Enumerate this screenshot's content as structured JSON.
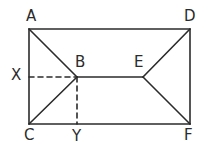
{
  "figure": {
    "kind": "geometry-diagram",
    "canvas": {
      "width": 205,
      "height": 151
    },
    "background_color": "#ffffff",
    "stroke_color": "#2b2b2b",
    "stroke_width": 1.6
  },
  "points": [
    {
      "id": "A",
      "label": "A",
      "x": 29,
      "y": 29,
      "label_x": 26,
      "label_y": 9,
      "kind": "rect-corner"
    },
    {
      "id": "D",
      "label": "D",
      "x": 190,
      "y": 29,
      "label_x": 184,
      "label_y": 9,
      "kind": "rect-corner"
    },
    {
      "id": "C",
      "label": "C",
      "x": 29,
      "y": 124,
      "label_x": 24,
      "label_y": 128,
      "kind": "rect-corner"
    },
    {
      "id": "F",
      "label": "F",
      "x": 190,
      "y": 124,
      "label_x": 184,
      "label_y": 128,
      "kind": "rect-corner"
    },
    {
      "id": "B",
      "label": "B",
      "x": 77,
      "y": 77,
      "label_x": 75,
      "label_y": 55,
      "kind": "interior-vertex"
    },
    {
      "id": "E",
      "label": "E",
      "x": 143,
      "y": 77,
      "label_x": 134,
      "label_y": 55,
      "kind": "interior-vertex"
    },
    {
      "id": "X",
      "label": "X",
      "x": 29,
      "y": 77,
      "label_x": 11,
      "label_y": 68,
      "kind": "foot-of-perpendicular"
    },
    {
      "id": "Y",
      "label": "Y",
      "x": 77,
      "y": 124,
      "label_x": 72,
      "label_y": 129,
      "kind": "foot-of-perpendicular"
    }
  ],
  "segments": [
    {
      "id": "AD",
      "from": "A",
      "to": "D",
      "style": "solid",
      "x1": 29,
      "y1": 29,
      "x2": 190,
      "y2": 29
    },
    {
      "id": "DF",
      "from": "D",
      "to": "F",
      "style": "solid",
      "x1": 190,
      "y1": 29,
      "x2": 190,
      "y2": 124
    },
    {
      "id": "FC",
      "from": "F",
      "to": "C",
      "style": "solid",
      "x1": 190,
      "y1": 124,
      "x2": 29,
      "y2": 124
    },
    {
      "id": "CA",
      "from": "C",
      "to": "A",
      "style": "solid",
      "x1": 29,
      "y1": 124,
      "x2": 29,
      "y2": 29
    },
    {
      "id": "AB",
      "from": "A",
      "to": "B",
      "style": "solid",
      "x1": 29,
      "y1": 29,
      "x2": 77,
      "y2": 77
    },
    {
      "id": "CB",
      "from": "C",
      "to": "B",
      "style": "solid",
      "x1": 29,
      "y1": 124,
      "x2": 77,
      "y2": 77
    },
    {
      "id": "BE",
      "from": "B",
      "to": "E",
      "style": "solid",
      "x1": 77,
      "y1": 77,
      "x2": 143,
      "y2": 77
    },
    {
      "id": "DE",
      "from": "D",
      "to": "E",
      "style": "solid",
      "x1": 190,
      "y1": 29,
      "x2": 143,
      "y2": 77
    },
    {
      "id": "FE",
      "from": "F",
      "to": "E",
      "style": "solid",
      "x1": 190,
      "y1": 124,
      "x2": 143,
      "y2": 77
    },
    {
      "id": "XB",
      "from": "X",
      "to": "B",
      "style": "dashed",
      "x1": 29,
      "y1": 77,
      "x2": 77,
      "y2": 77
    },
    {
      "id": "BY",
      "from": "B",
      "to": "Y",
      "style": "dashed",
      "x1": 77,
      "y1": 77,
      "x2": 77,
      "y2": 124
    }
  ],
  "dash_pattern": "5,4"
}
